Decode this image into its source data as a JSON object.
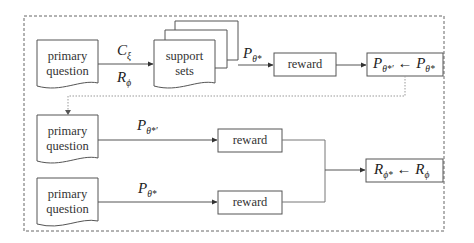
{
  "diagram": {
    "nodes": {
      "primary_question_1": {
        "label_line1": "primary",
        "label_line2": "question"
      },
      "support_sets": {
        "label_line1": "support",
        "label_line2": "sets"
      },
      "reward_1": {
        "label": "reward"
      },
      "policy_update": {
        "lhs_base": "P",
        "lhs_sub": "θ*′",
        "arrow": "←",
        "rhs_base": "P",
        "rhs_sub": "θ*"
      },
      "primary_question_2": {
        "label_line1": "primary",
        "label_line2": "question"
      },
      "primary_question_3": {
        "label_line1": "primary",
        "label_line2": "question"
      },
      "reward_2": {
        "label": "reward"
      },
      "reward_3": {
        "label": "reward"
      },
      "reward_update": {
        "lhs_base": "R",
        "lhs_sub": "ϕ*",
        "arrow": "←",
        "rhs_base": "R",
        "rhs_sub": "ϕ"
      }
    },
    "edge_labels": {
      "c_xi": {
        "base": "C",
        "sub": "ξ"
      },
      "r_phi": {
        "base": "R",
        "sub": "ϕ"
      },
      "p_theta_star_top": {
        "base": "P",
        "sub": "θ*"
      },
      "p_theta_star_prime": {
        "base": "P",
        "sub": "θ*′"
      },
      "p_theta_star_bottom": {
        "base": "P",
        "sub": "θ*"
      }
    },
    "colors": {
      "stroke": "#555555",
      "dashed_border": "#666666",
      "dotted_feedback": "#999999"
    }
  }
}
